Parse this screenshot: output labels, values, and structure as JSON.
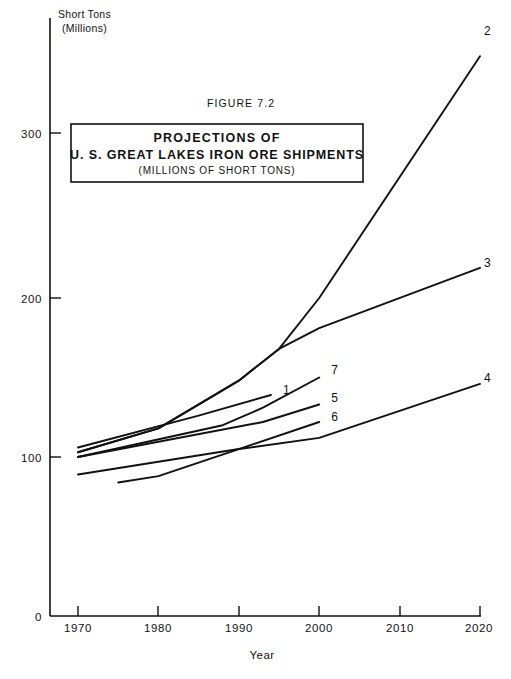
{
  "figure": {
    "figure_number": "FIGURE 7.2",
    "title_line_1": "PROJECTIONS OF",
    "title_line_2": "U. S. GREAT LAKES IRON ORE SHIPMENTS",
    "title_line_3": "(MILLIONS OF SHORT TONS)",
    "y_unit_line_1": "Short Tons",
    "y_unit_line_2": "(Millions)"
  },
  "chart_data": {
    "type": "line",
    "subtitle": "FIGURE 7.2",
    "xlabel": "Year",
    "ylabel": "Short Tons (Millions)",
    "xlim": [
      1970,
      2020
    ],
    "ylim": [
      0,
      330
    ],
    "x_ticks": [
      1970,
      1980,
      1990,
      2000,
      2010,
      2020
    ],
    "x_tick_labels": [
      "1970",
      "1980",
      "1990",
      "2000",
      "2010",
      "2020"
    ],
    "y_ticks": [
      0,
      100,
      200,
      300
    ],
    "y_tick_labels": [
      "0",
      "100",
      "200",
      "300"
    ],
    "grid": false,
    "legend": "inline-end-labels",
    "series": [
      {
        "name": "2",
        "label": "2",
        "points": [
          [
            1970,
            103
          ],
          [
            1980,
            118
          ],
          [
            1990,
            148
          ],
          [
            1995,
            168
          ],
          [
            2000,
            200
          ],
          [
            2020,
            352
          ]
        ]
      },
      {
        "name": "3",
        "label": "3",
        "points": [
          [
            1970,
            103
          ],
          [
            1980,
            118
          ],
          [
            1990,
            148
          ],
          [
            1995,
            168
          ],
          [
            2000,
            181
          ],
          [
            2020,
            219
          ]
        ]
      },
      {
        "name": "1",
        "label": "1",
        "points": [
          [
            1970,
            106
          ],
          [
            1985,
            126
          ],
          [
            1994,
            139
          ]
        ]
      },
      {
        "name": "7",
        "label": "7",
        "points": [
          [
            1970,
            100
          ],
          [
            1988,
            120
          ],
          [
            1993,
            131
          ],
          [
            2000,
            150
          ]
        ]
      },
      {
        "name": "5",
        "label": "5",
        "points": [
          [
            1970,
            100
          ],
          [
            1993,
            122
          ],
          [
            2000,
            133
          ]
        ]
      },
      {
        "name": "6",
        "label": "6",
        "points": [
          [
            1975,
            84
          ],
          [
            1980,
            88
          ],
          [
            1990,
            105
          ],
          [
            2000,
            122
          ]
        ]
      },
      {
        "name": "4",
        "label": "4",
        "points": [
          [
            1970,
            89
          ],
          [
            1990,
            105
          ],
          [
            2000,
            112
          ],
          [
            2020,
            146
          ]
        ]
      }
    ],
    "series_tag_positions": [
      {
        "label": "2",
        "x": 2020,
        "y": 368
      },
      {
        "label": "3",
        "x": 2020,
        "y": 222
      },
      {
        "label": "4",
        "x": 2020,
        "y": 150
      },
      {
        "label": "7",
        "x": 2001,
        "y": 155
      },
      {
        "label": "1",
        "x": 1995,
        "y": 142
      },
      {
        "label": "5",
        "x": 2001,
        "y": 137
      },
      {
        "label": "6",
        "x": 2001,
        "y": 125
      }
    ]
  }
}
